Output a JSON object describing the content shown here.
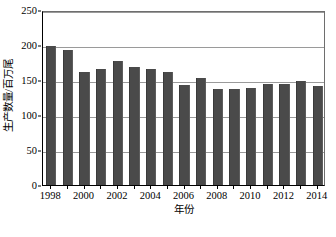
{
  "chart_data": {
    "type": "bar",
    "title": "",
    "subtitle": "",
    "xlabel": "年份",
    "ylabel": "生产数量/百万尾",
    "categories": [
      "1998",
      "1999",
      "2000",
      "2001",
      "2002",
      "2003",
      "2004",
      "2005",
      "2006",
      "2007",
      "2008",
      "2009",
      "2010",
      "2011",
      "2012",
      "2013",
      "2014"
    ],
    "values": [
      198,
      193,
      162,
      166,
      177,
      169,
      166,
      162,
      143,
      153,
      137,
      137,
      138,
      144,
      145,
      149,
      142
    ],
    "series": [
      {
        "name": "生产数量",
        "values": [
          198,
          193,
          162,
          166,
          177,
          169,
          166,
          162,
          143,
          153,
          137,
          137,
          138,
          144,
          145,
          149,
          142
        ]
      }
    ],
    "ylim": [
      0,
      250
    ],
    "yticks": [
      0,
      50,
      100,
      150,
      200,
      250
    ],
    "ytick_labels": [
      "0",
      "50",
      "100",
      "150",
      "200",
      "250"
    ],
    "xtick_labels": [
      "1998",
      "2000",
      "2002",
      "2004",
      "2006",
      "2008",
      "2010",
      "2012",
      "2014"
    ],
    "xtick_categories": [
      "1998",
      "2000",
      "2002",
      "2004",
      "2006",
      "2008",
      "2010",
      "2012",
      "2014"
    ],
    "grid": true,
    "grid_axis": "y",
    "legend": false,
    "legend_position": "none",
    "annotations": [],
    "colors": {
      "bar": "#4a4a4a",
      "gridline": "#9a9a9a",
      "axis": "#000000",
      "background": "#ffffff",
      "text": "#000000"
    }
  }
}
